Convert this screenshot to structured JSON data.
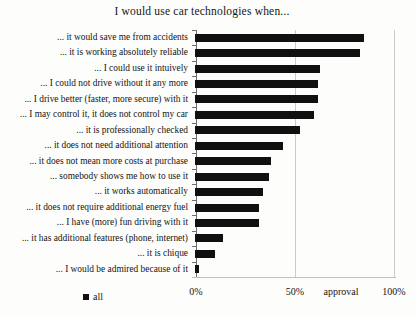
{
  "chart_data": {
    "type": "bar",
    "orientation": "horizontal",
    "title": "I would use car technologies when...",
    "categories": [
      "... it would save me from accidents",
      "... it is working absolutely reliable",
      "... I could use it intuively",
      "... I could not drive without it any more",
      "... I drive better (faster, more secure) with it",
      "... I may control it, it does not control my car",
      "... it is professionally checked",
      "... it does not need additional attention",
      "... it does not mean more costs at purchase",
      "... somebody shows me how to use it",
      "... it works automatically",
      "... it does not require additional energy fuel",
      "... I have (more) fun driving with it",
      "... it has additional features (phone, internet)",
      "... it is chique",
      "... I would be admired because of it"
    ],
    "values": [
      84,
      82,
      62,
      61,
      61,
      59,
      52,
      44,
      38,
      37,
      34,
      32,
      32,
      14,
      10,
      2
    ],
    "series_name": "all",
    "xlabel": "approval",
    "xlim": [
      0,
      100
    ],
    "x_ticks": [
      "0%",
      "50%",
      "100%"
    ],
    "grid": "vertical-only",
    "legend_position": "bottom-left",
    "bar_color": "#101010",
    "gridline_color": "#cccbc8"
  }
}
